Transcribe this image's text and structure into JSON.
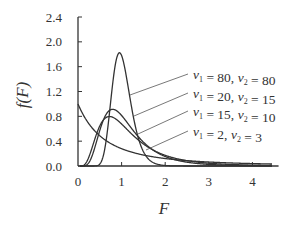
{
  "chart_data": {
    "type": "line",
    "title": "",
    "xlabel": "F",
    "ylabel": "f(F)",
    "xlim": [
      0,
      4.6
    ],
    "ylim": [
      0,
      2.4
    ],
    "xticks": [
      "0",
      "1",
      "2",
      "3",
      "4"
    ],
    "yticks": [
      "0.0",
      "0.4",
      "0.8",
      "1.2",
      "1.6",
      "2.0",
      "2.4"
    ],
    "grid": false,
    "legend_position": "annotations-right",
    "series": [
      {
        "name": "ν1 = 80,  ν2 = 80",
        "nu1": 80,
        "nu2": 80,
        "peak": {
          "x": 0.98,
          "y": 1.78
        }
      },
      {
        "name": "ν1 = 20,  ν2 = 15",
        "nu1": 20,
        "nu2": 15,
        "peak": {
          "x": 0.82,
          "y": 0.92
        }
      },
      {
        "name": "ν1 = 15,  ν2 = 10",
        "nu1": 15,
        "nu2": 10,
        "peak": {
          "x": 0.78,
          "y": 0.84
        }
      },
      {
        "name": "ν1 = 2,  ν2 = 3",
        "nu1": 2,
        "nu2": 3,
        "peak": {
          "x": 0.0,
          "y": 0.82
        }
      }
    ]
  },
  "labels": {
    "ylabel": "f(F)",
    "xlabel": "F",
    "legend": [
      {
        "nu1": "80",
        "nu2": "80"
      },
      {
        "nu1": "20",
        "nu2": "15"
      },
      {
        "nu1": "15",
        "nu2": "10"
      },
      {
        "nu1": "2",
        "nu2": "3"
      }
    ]
  }
}
